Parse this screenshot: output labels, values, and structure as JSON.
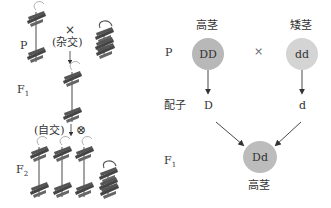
{
  "left_panel": {
    "generation_labels": {
      "p": "P",
      "f1": "F",
      "f1_sub": "1",
      "f2": "F",
      "f2_sub": "2"
    },
    "cross_symbol": "×",
    "cross_label": "(杂交)",
    "self_label": "(自交)",
    "self_symbol": "⊗",
    "plants": {
      "p": [
        "tall",
        "dwarf"
      ],
      "f1": [
        "tall"
      ],
      "f2": [
        "tall",
        "tall",
        "tall",
        "dwarf"
      ]
    }
  },
  "right_panel": {
    "row_labels": {
      "p": "P",
      "gametes": "配子",
      "f1": "F",
      "f1_sub": "1"
    },
    "parents": [
      {
        "phenotype": "高茎",
        "genotype": "DD",
        "color": "#b8b8b8"
      },
      {
        "phenotype": "矮茎",
        "genotype": "dd",
        "color": "#d4d4d4"
      }
    ],
    "cross_symbol": "×",
    "gametes": [
      "D",
      "d"
    ],
    "offspring": {
      "genotype": "Dd",
      "phenotype": "高茎",
      "color": "#bcbcbc"
    }
  }
}
